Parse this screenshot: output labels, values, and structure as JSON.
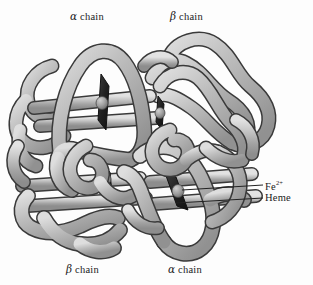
{
  "figure": {
    "title_labels": {
      "alpha_top": {
        "greek": "α",
        "text": " chain"
      },
      "beta_top": {
        "greek": "β",
        "text": " chain"
      },
      "beta_bottom": {
        "greek": "β",
        "text": " chain"
      },
      "alpha_bottom": {
        "greek": "α",
        "text": " chain"
      }
    },
    "callouts": {
      "iron": {
        "symbol": "Fe",
        "charge": "2+"
      },
      "heme": {
        "label": "Heme"
      }
    },
    "colors": {
      "background": "#fdfdfd",
      "tube_light": "#d8d8d8",
      "tube_mid": "#b3b3b3",
      "tube_dark": "#8a8a8a",
      "outline": "#3a3a3a",
      "heme_disc": "#2b2b2b",
      "iron_sphere": "#9a9a9a",
      "text": "#1b1b1b",
      "leader_line": "#222222"
    },
    "structure": {
      "subunit_count": 4,
      "heme_group_count": 4,
      "heme_positions": [
        {
          "cx": 103,
          "cy": 103
        },
        {
          "cx": 160,
          "cy": 113
        },
        {
          "cx": 107,
          "cy": 181
        },
        {
          "cx": 176,
          "cy": 196
        }
      ],
      "iron_positions": [
        {
          "cx": 102,
          "cy": 103
        },
        {
          "cx": 160,
          "cy": 113
        },
        {
          "cx": 106,
          "cy": 179
        },
        {
          "cx": 178,
          "cy": 191
        }
      ]
    }
  }
}
